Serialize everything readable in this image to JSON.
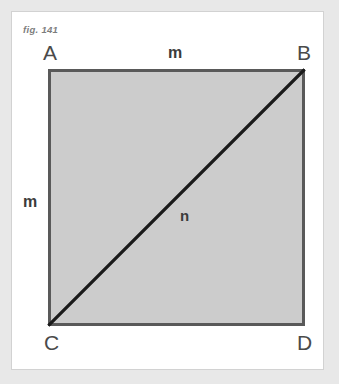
{
  "figure": {
    "caption": "fig. 141",
    "type": "geometry-diagram",
    "shape": "square-with-diagonal",
    "colors": {
      "page_background": "#e8e8e8",
      "sheet_background": "#ffffff",
      "sheet_border": "#d2d2d2",
      "square_fill": "#cccccc",
      "square_border": "#595959",
      "diagonal_stroke": "#1a1a1a",
      "vertex_label_color": "#4a4a4a",
      "measure_label_color": "#3b3b3b",
      "caption_color": "#7d7d7d"
    },
    "vertices": [
      {
        "id": "A",
        "label": "A",
        "position": "top-left"
      },
      {
        "id": "B",
        "label": "B",
        "position": "top-right"
      },
      {
        "id": "C",
        "label": "C",
        "position": "bottom-left"
      },
      {
        "id": "D",
        "label": "D",
        "position": "bottom-right"
      }
    ],
    "measures": [
      {
        "id": "top-side",
        "label": "m",
        "edge": "AB"
      },
      {
        "id": "left-side",
        "label": "m",
        "edge": "AC"
      },
      {
        "id": "diagonal",
        "label": "n",
        "edge": "BC"
      }
    ],
    "diagonal": {
      "from": "B",
      "to": "C",
      "stroke_width": 3
    }
  }
}
